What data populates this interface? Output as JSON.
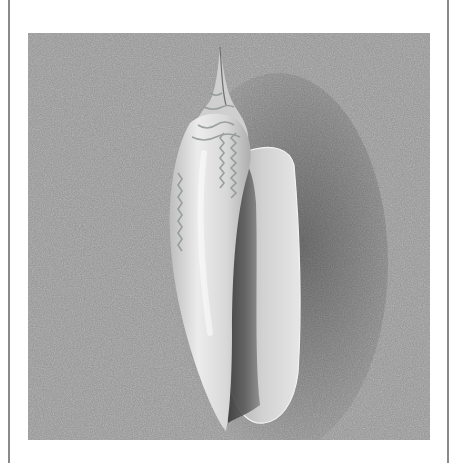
{
  "figure": {
    "alt": "Grayscale photograph of an elongated spiral seashell with a pointed spire, resting on fine gray sand",
    "colors": {
      "page_background": "#ffffff",
      "frame_line": "#8a8a8a",
      "sand": "#9a9a9a",
      "sand_dark": "#7d7d7d",
      "shell_light": "#e8e8e8",
      "shell_mid": "#c9c9c9",
      "shell_pattern": "#8f9690",
      "aperture_shadow": "#3e3e3e"
    }
  }
}
